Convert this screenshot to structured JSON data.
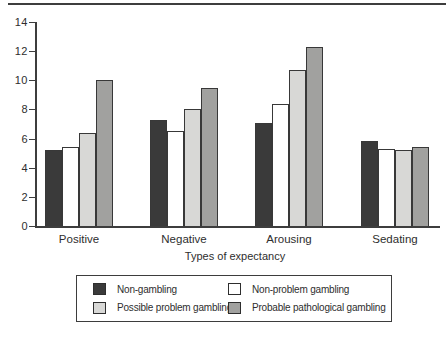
{
  "chart_data": {
    "type": "bar",
    "title": "",
    "xlabel": "Types of expectancy",
    "ylabel": "",
    "ylim": [
      0,
      14
    ],
    "yticks": [
      0,
      2,
      4,
      6,
      8,
      10,
      12,
      14
    ],
    "grid": false,
    "legend_position": "bottom-boxed-2x2",
    "categories": [
      "Positive",
      "Negative",
      "Arousing",
      "Sedating"
    ],
    "series": [
      {
        "name": "Non-gambling",
        "color": "#3a3a3a",
        "values": [
          5.2,
          7.3,
          7.1,
          5.8
        ]
      },
      {
        "name": "Non-problem gambling",
        "color": "#ffffff",
        "values": [
          5.4,
          6.5,
          8.4,
          5.3
        ]
      },
      {
        "name": "Possible problem gambling",
        "color": "#d8d8d6",
        "values": [
          6.4,
          8.0,
          10.7,
          5.2
        ]
      },
      {
        "name": "Probable pathological gambling",
        "color": "#a1a19f",
        "values": [
          10.0,
          9.5,
          12.3,
          5.4
        ]
      }
    ]
  },
  "colors": {
    "axis": "#3d3d3d",
    "text": "#2e2e2e",
    "rule": "#3d3d3d"
  }
}
